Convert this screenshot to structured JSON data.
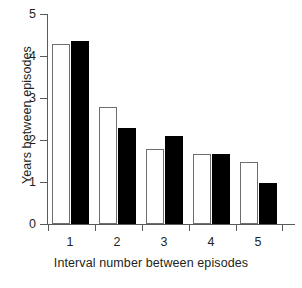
{
  "chart_data": {
    "type": "bar",
    "title": "",
    "xlabel": "Interval number between episodes",
    "ylabel": "Years between episodes",
    "categories": [
      "1",
      "2",
      "3",
      "4",
      "5"
    ],
    "series": [
      {
        "name": "white",
        "values": [
          4.28,
          2.79,
          1.79,
          1.67,
          1.48
        ]
      },
      {
        "name": "black",
        "values": [
          4.36,
          2.29,
          2.1,
          1.67,
          0.98
        ]
      }
    ],
    "ylim": [
      0,
      5
    ],
    "yticks": [
      "0",
      "1",
      "2",
      "3",
      "4",
      "5"
    ],
    "ytick_values": [
      0,
      1,
      2,
      3,
      4,
      5
    ],
    "xtick_labels": [
      "1",
      "2",
      "3",
      "4",
      "5"
    ],
    "grid": false,
    "legend": "none",
    "colors": {
      "series_white_fill": "#ffffff",
      "series_white_edge": "#6d6e71",
      "series_black_fill": "#000000",
      "axis": "#58595b",
      "text": "#231f20",
      "background": "#ffffff"
    }
  },
  "caption": {
    "text": ""
  }
}
